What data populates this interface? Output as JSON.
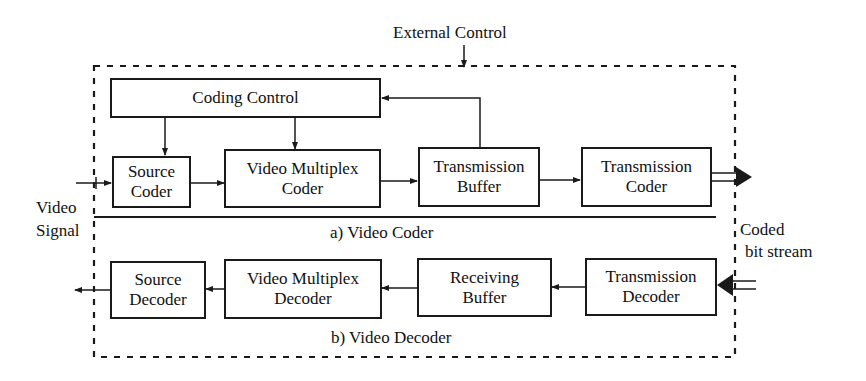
{
  "diagram": {
    "external_control": "External Control",
    "video_signal": {
      "line1": "Video",
      "line2": "Signal"
    },
    "coded_bit_stream": {
      "line1": "Coded",
      "line2": "bit stream"
    },
    "coder": {
      "caption": "a)  Video Coder",
      "coding_control": "Coding Control",
      "blocks": [
        {
          "line1": "Source",
          "line2": "Coder"
        },
        {
          "line1": "Video Multiplex",
          "line2": "Coder"
        },
        {
          "line1": "Transmission",
          "line2": "Buffer"
        },
        {
          "line1": "Transmission",
          "line2": "Coder"
        }
      ]
    },
    "decoder": {
      "caption": "b)  Video Decoder",
      "blocks": [
        {
          "line1": "Source",
          "line2": "Decoder"
        },
        {
          "line1": "Video Multiplex",
          "line2": "Decoder"
        },
        {
          "line1": "Receiving",
          "line2": "Buffer"
        },
        {
          "line1": "Transmission",
          "line2": "Decoder"
        }
      ]
    },
    "colors": {
      "line": "#1a1a1a",
      "background": "#ffffff"
    }
  }
}
